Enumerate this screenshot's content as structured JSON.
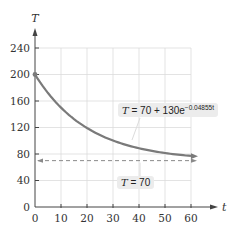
{
  "chart_data": {
    "type": "line",
    "title": "",
    "xlabel": "t",
    "ylabel": "T",
    "xlim": [
      0,
      60
    ],
    "ylim": [
      0,
      240
    ],
    "x_ticks": [
      0,
      10,
      20,
      30,
      40,
      50,
      60
    ],
    "y_ticks": [
      0,
      40,
      80,
      120,
      160,
      200,
      240
    ],
    "grid": true,
    "series": [
      {
        "name": "T = 70 + 130e^(-0.04855t)",
        "equation": "T = 70 + 130e^(-0.04855t)",
        "color": "#7a7a7a",
        "style": "solid",
        "x": [
          0,
          5,
          10,
          15,
          20,
          25,
          30,
          35,
          40,
          45,
          50,
          55,
          60
        ],
        "values": [
          200,
          172.2,
          150.1,
          132.6,
          118.7,
          107.8,
          99.1,
          92.2,
          76.7,
          84.6,
          81.4,
          79.1,
          77.1
        ]
      },
      {
        "name": "T = 70",
        "equation": "T = 70",
        "color": "#8a8a8a",
        "style": "dashed",
        "x": [
          0,
          60
        ],
        "values": [
          70,
          70
        ]
      }
    ],
    "annotations": [
      {
        "text": "T = 70 + 130e^(-0.04855t)",
        "target": "curve"
      },
      {
        "text": "T = 70",
        "target": "asymptote"
      }
    ]
  },
  "labels": {
    "y_axis": "T",
    "x_axis": "t",
    "eq_curve_lhs": "T",
    "eq_curve_rhs": " = 70 + 130e",
    "eq_curve_exp": "−0.04855t",
    "eq_asym_lhs": "T",
    "eq_asym_rhs": " = 70"
  },
  "ticks": {
    "x": [
      "0",
      "10",
      "20",
      "30",
      "40",
      "50",
      "60"
    ],
    "y": [
      "0",
      "40",
      "80",
      "120",
      "160",
      "200",
      "240"
    ]
  }
}
